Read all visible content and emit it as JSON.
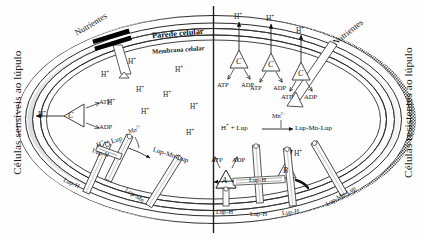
{
  "figure": {
    "type": "biological-cell-diagram",
    "divider": "vertical line splitting cell into sensitive (left) and resistant (right) halves"
  },
  "side_labels": {
    "left": "Células sensíveis ao lúpulo",
    "right": "Células resistentes ao lúpulo"
  },
  "structures": {
    "cell_wall": "Parede celular",
    "cell_membrane": "Membrana celular"
  },
  "nutrients": {
    "left_label": "Nutrientes",
    "right_label": "Nutrientes",
    "left_blocked": true,
    "right_blocked": false
  },
  "ions": {
    "proton": "H+",
    "proton_html": "H⁺",
    "manganese": "Mn2+",
    "manganese_html": "Mn²⁺"
  },
  "left_half": {
    "protons_interior": [
      "H+",
      "H+",
      "H+",
      "H+",
      "H+",
      "H+",
      "H+",
      "H+",
      "H+"
    ],
    "proton_efflux": "H+",
    "carrier": {
      "name": "C",
      "substrate_in": "ATP",
      "substrate_out": "ADP"
    },
    "reaction": {
      "reactants": "H+ + Lup",
      "catalyst": "Mn2+",
      "product": "Lup-Mn-Lup"
    },
    "transporters": [
      {
        "label": "Lup-H"
      },
      {
        "label": "Lup-H"
      },
      {
        "label": "Lup-Mn-Lup"
      },
      {
        "label": "Lup-Mn"
      }
    ]
  },
  "right_half": {
    "carriers": [
      {
        "name": "C",
        "substrate_in": "ATP",
        "substrate_out": "ADP",
        "efflux": "H+"
      },
      {
        "name": "C",
        "substrate_in": "ATP",
        "substrate_out": "ADP",
        "efflux": "H+"
      },
      {
        "name": "C",
        "substrate_in": "ATP",
        "substrate_out": "ADP",
        "efflux": "H+"
      }
    ],
    "pump_a": {
      "name": "A",
      "substrate_in": "ATP",
      "substrate_out": "ADP",
      "cargo": "Lup-H"
    },
    "pump_b": {
      "name": "B",
      "efflux": "H+",
      "cargo": "Lup-H"
    },
    "reaction": {
      "reactants": "H+ + Lup",
      "catalyst": "Mn2+",
      "product": "Lup-Mn-Lup"
    },
    "transporters": [
      {
        "label": "Lup-H"
      },
      {
        "label": "Lup-H"
      },
      {
        "label": "Lup-H"
      },
      {
        "label": "Lup-Mn-Lup"
      }
    ],
    "internal_label": "Lup-H"
  },
  "colors": {
    "wall_fill": "#9a9a9a",
    "membrane_fill": "#e8e8e8",
    "stroke": "#2b2b2b",
    "text": "#141414",
    "background": "#ffffff"
  }
}
